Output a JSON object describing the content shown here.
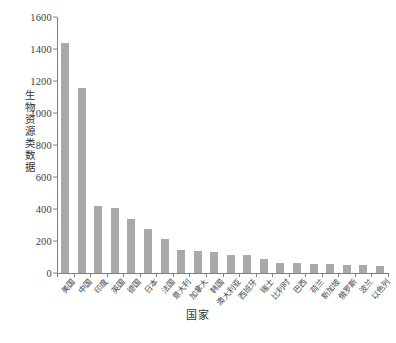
{
  "chart_data": {
    "type": "bar",
    "title": "",
    "xlabel": "国家",
    "ylabel": "生物资源类数据",
    "ylim": [
      0,
      1600
    ],
    "ytick_step": 200,
    "yticks": [
      "0",
      "200",
      "400",
      "600",
      "800",
      "1000",
      "1200",
      "1400",
      "1600"
    ],
    "grid": false,
    "legend": false,
    "bar_color": "#a9a9a9",
    "axis_color": "#808080",
    "categories": [
      "美国",
      "中国",
      "印度",
      "英国",
      "德国",
      "日本",
      "法国",
      "意大利",
      "加拿大",
      "韩国",
      "澳大利亚",
      "西班牙",
      "瑞士",
      "比利时",
      "巴西",
      "荷兰",
      "新加坡",
      "俄罗斯",
      "波兰",
      "以色列"
    ],
    "values": [
      1435,
      1155,
      420,
      405,
      340,
      275,
      210,
      145,
      135,
      130,
      115,
      113,
      90,
      65,
      62,
      55,
      55,
      50,
      47,
      42
    ]
  },
  "caption": {
    "text": ""
  }
}
